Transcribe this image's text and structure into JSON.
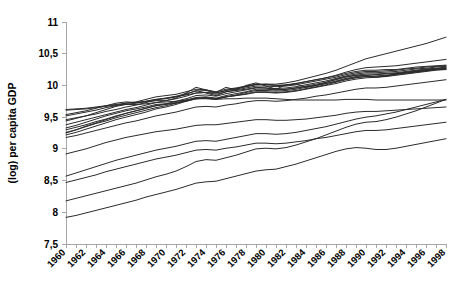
{
  "chart_data": {
    "type": "line",
    "title": "",
    "subtitle": "",
    "xlabel": "",
    "ylabel": "(log) per capita GDP",
    "xlim": [
      1960,
      1998
    ],
    "ylim": [
      7.5,
      11
    ],
    "grid": false,
    "legend": false,
    "legend_position": "none",
    "line_color": "#2b2b2b",
    "axis_color": "#a6a6a6",
    "ytick_labels": [
      "7,5",
      "8",
      "8,5",
      "9",
      "9,5",
      "10",
      "10,5",
      "11"
    ],
    "ytick_values": [
      7.5,
      8,
      8.5,
      9,
      9.5,
      10,
      10.5,
      11
    ],
    "xtick_labels": [
      "1960",
      "1962",
      "1964",
      "1966",
      "1968",
      "1970",
      "1972",
      "1974",
      "1976",
      "1978",
      "1980",
      "1982",
      "1984",
      "1986",
      "1988",
      "1990",
      "1992",
      "1994",
      "1996",
      "1998"
    ],
    "xtick_values": [
      1960,
      1962,
      1964,
      1966,
      1968,
      1970,
      1972,
      1974,
      1976,
      1978,
      1980,
      1982,
      1984,
      1986,
      1988,
      1990,
      1992,
      1994,
      1996,
      1998
    ],
    "x": [
      1960,
      1961,
      1962,
      1963,
      1964,
      1965,
      1966,
      1967,
      1968,
      1969,
      1970,
      1971,
      1972,
      1973,
      1974,
      1975,
      1976,
      1977,
      1978,
      1979,
      1980,
      1981,
      1982,
      1983,
      1984,
      1985,
      1986,
      1987,
      1988,
      1989,
      1990,
      1991,
      1992,
      1993,
      1994,
      1995,
      1996,
      1997,
      1998
    ],
    "series": [
      {
        "name": "series-1",
        "values": [
          9.62,
          9.63,
          9.64,
          9.66,
          9.68,
          9.7,
          9.72,
          9.73,
          9.75,
          9.78,
          9.8,
          9.82,
          9.85,
          9.88,
          9.89,
          9.88,
          9.92,
          9.95,
          9.98,
          10.01,
          10.02,
          10.02,
          10.04,
          10.07,
          10.11,
          10.15,
          10.19,
          10.24,
          10.3,
          10.36,
          10.42,
          10.46,
          10.5,
          10.54,
          10.58,
          10.62,
          10.66,
          10.71,
          10.76
        ]
      },
      {
        "name": "series-2",
        "values": [
          9.52,
          9.55,
          9.58,
          9.61,
          9.65,
          9.68,
          9.72,
          9.74,
          9.78,
          9.82,
          9.84,
          9.86,
          9.9,
          9.94,
          9.93,
          9.9,
          9.94,
          9.96,
          9.99,
          10.02,
          10.01,
          10.0,
          10.01,
          10.03,
          10.06,
          10.09,
          10.12,
          10.16,
          10.21,
          10.25,
          10.28,
          10.29,
          10.3,
          10.31,
          10.33,
          10.35,
          10.37,
          10.39,
          10.41
        ]
      },
      {
        "name": "series-3",
        "values": [
          9.46,
          9.49,
          9.52,
          9.55,
          9.59,
          9.62,
          9.66,
          9.69,
          9.73,
          9.77,
          9.8,
          9.83,
          9.87,
          9.91,
          9.92,
          9.88,
          9.92,
          9.95,
          9.98,
          10.02,
          10.02,
          10.0,
          10.0,
          10.03,
          10.06,
          10.09,
          10.12,
          10.15,
          10.19,
          10.22,
          10.24,
          10.24,
          10.25,
          10.25,
          10.27,
          10.29,
          10.3,
          10.31,
          10.32
        ]
      },
      {
        "name": "series-4",
        "values": [
          9.38,
          9.42,
          9.46,
          9.5,
          9.54,
          9.58,
          9.62,
          9.65,
          9.69,
          9.73,
          9.76,
          9.79,
          9.83,
          9.88,
          9.89,
          9.86,
          9.9,
          9.93,
          9.96,
          9.99,
          9.99,
          9.98,
          9.99,
          10.01,
          10.04,
          10.07,
          10.1,
          10.13,
          10.17,
          10.2,
          10.22,
          10.22,
          10.23,
          10.24,
          10.26,
          10.27,
          10.29,
          10.3,
          10.31
        ]
      },
      {
        "name": "series-5",
        "values": [
          9.3,
          9.34,
          9.38,
          9.43,
          9.47,
          9.52,
          9.56,
          9.6,
          9.64,
          9.68,
          9.71,
          9.75,
          9.79,
          9.84,
          9.85,
          9.83,
          9.87,
          9.9,
          9.93,
          9.96,
          9.96,
          9.95,
          9.96,
          9.98,
          10.01,
          10.04,
          10.07,
          10.11,
          10.15,
          10.18,
          10.2,
          10.2,
          10.21,
          10.22,
          10.24,
          10.26,
          10.27,
          10.29,
          10.3
        ]
      },
      {
        "name": "series-6",
        "values": [
          9.26,
          9.3,
          9.35,
          9.4,
          9.44,
          9.49,
          9.53,
          9.57,
          9.61,
          9.65,
          9.68,
          9.72,
          9.77,
          9.81,
          9.82,
          9.8,
          9.84,
          9.87,
          9.9,
          9.94,
          9.94,
          9.93,
          9.94,
          9.96,
          9.99,
          10.02,
          10.05,
          10.09,
          10.13,
          10.16,
          10.18,
          10.18,
          10.19,
          10.2,
          10.22,
          10.24,
          10.26,
          10.27,
          10.29
        ]
      },
      {
        "name": "series-7",
        "values": [
          9.22,
          9.26,
          9.31,
          9.36,
          9.41,
          9.46,
          9.5,
          9.54,
          9.58,
          9.63,
          9.66,
          9.7,
          9.75,
          9.79,
          9.8,
          9.78,
          9.82,
          9.85,
          9.89,
          9.92,
          9.92,
          9.91,
          9.92,
          9.94,
          9.97,
          10.0,
          10.03,
          10.07,
          10.11,
          10.14,
          10.16,
          10.17,
          10.18,
          10.19,
          10.21,
          10.23,
          10.25,
          10.26,
          10.28
        ]
      },
      {
        "name": "series-8",
        "values": [
          9.25,
          9.3,
          9.36,
          9.41,
          9.46,
          9.51,
          9.56,
          9.6,
          9.64,
          9.68,
          9.7,
          9.72,
          9.75,
          9.79,
          9.8,
          9.79,
          9.82,
          9.84,
          9.87,
          9.9,
          9.9,
          9.89,
          9.9,
          9.92,
          9.95,
          9.98,
          10.01,
          10.05,
          10.09,
          10.12,
          10.14,
          10.15,
          10.16,
          10.18,
          10.2,
          10.22,
          10.24,
          10.26,
          10.27
        ]
      },
      {
        "name": "series-9",
        "values": [
          9.33,
          9.37,
          9.42,
          9.47,
          9.52,
          9.56,
          9.6,
          9.63,
          9.66,
          9.7,
          9.71,
          9.73,
          9.76,
          9.8,
          9.81,
          9.79,
          9.82,
          9.84,
          9.86,
          9.89,
          9.89,
          9.88,
          9.89,
          9.91,
          9.94,
          9.97,
          10.0,
          10.03,
          10.07,
          10.1,
          10.12,
          10.13,
          10.15,
          10.17,
          10.19,
          10.21,
          10.23,
          10.25,
          10.26
        ]
      },
      {
        "name": "series-10",
        "values": [
          9.44,
          9.48,
          9.52,
          9.57,
          9.62,
          9.67,
          9.7,
          9.72,
          9.74,
          9.76,
          9.76,
          9.8,
          9.88,
          9.97,
          9.93,
          9.89,
          9.97,
          9.93,
          10.0,
          10.04,
          9.99,
          9.94,
          10.01,
          10.02,
          9.97,
          10.0,
          10.05,
          10.1,
          10.14,
          10.16,
          10.16,
          10.13,
          10.15,
          10.18,
          10.2,
          10.22,
          10.23,
          10.25,
          10.26
        ]
      },
      {
        "name": "series-11",
        "values": [
          9.54,
          9.57,
          9.6,
          9.64,
          9.68,
          9.72,
          9.74,
          9.73,
          9.75,
          9.78,
          9.79,
          9.82,
          9.86,
          9.92,
          9.88,
          9.84,
          9.9,
          9.92,
          9.94,
          9.97,
          9.96,
          9.93,
          9.94,
          9.96,
          9.98,
          10.0,
          10.03,
          10.06,
          10.1,
          10.13,
          10.14,
          10.13,
          10.14,
          10.16,
          10.18,
          10.2,
          10.22,
          10.24,
          10.25
        ]
      },
      {
        "name": "series-12",
        "values": [
          9.61,
          9.62,
          9.63,
          9.65,
          9.67,
          9.69,
          9.7,
          9.7,
          9.71,
          9.73,
          9.74,
          9.75,
          9.77,
          9.79,
          9.79,
          9.78,
          9.79,
          9.79,
          9.8,
          9.8,
          9.8,
          9.79,
          9.78,
          9.77,
          9.77,
          9.77,
          9.77,
          9.77,
          9.78,
          9.78,
          9.78,
          9.77,
          9.77,
          9.77,
          9.77,
          9.77,
          9.77,
          9.77,
          9.77
        ]
      },
      {
        "name": "series-13",
        "values": [
          9.18,
          9.21,
          9.25,
          9.29,
          9.33,
          9.37,
          9.41,
          9.44,
          9.48,
          9.52,
          9.55,
          9.58,
          9.62,
          9.66,
          9.67,
          9.66,
          9.69,
          9.71,
          9.74,
          9.76,
          9.76,
          9.75,
          9.76,
          9.78,
          9.8,
          9.83,
          9.85,
          9.88,
          9.91,
          9.94,
          9.96,
          9.96,
          9.97,
          9.99,
          10.01,
          10.03,
          10.05,
          10.07,
          10.09
        ]
      },
      {
        "name": "series-14",
        "values": [
          8.92,
          8.96,
          9.0,
          9.05,
          9.1,
          9.14,
          9.18,
          9.21,
          9.24,
          9.27,
          9.29,
          9.31,
          9.34,
          9.37,
          9.38,
          9.38,
          9.4,
          9.42,
          9.44,
          9.46,
          9.46,
          9.45,
          9.45,
          9.46,
          9.47,
          9.49,
          9.51,
          9.53,
          9.56,
          9.58,
          9.59,
          9.59,
          9.6,
          9.61,
          9.62,
          9.63,
          9.64,
          9.65,
          9.66
        ]
      },
      {
        "name": "series-15",
        "values": [
          8.57,
          8.62,
          8.67,
          8.72,
          8.77,
          8.82,
          8.86,
          8.9,
          8.94,
          8.98,
          9.01,
          9.04,
          9.08,
          9.12,
          9.13,
          9.12,
          9.15,
          9.18,
          9.21,
          9.24,
          9.24,
          9.23,
          9.24,
          9.26,
          9.29,
          9.32,
          9.35,
          9.39,
          9.43,
          9.47,
          9.5,
          9.52,
          9.55,
          9.58,
          9.62,
          9.66,
          9.7,
          9.74,
          9.78
        ]
      },
      {
        "name": "series-16",
        "values": [
          8.47,
          8.51,
          8.55,
          8.59,
          8.64,
          8.68,
          8.72,
          8.76,
          8.8,
          8.84,
          8.87,
          8.9,
          8.94,
          8.98,
          8.99,
          8.98,
          9.01,
          9.03,
          9.06,
          9.09,
          9.09,
          9.08,
          9.09,
          9.11,
          9.13,
          9.16,
          9.18,
          9.21,
          9.24,
          9.27,
          9.29,
          9.29,
          9.3,
          9.32,
          9.34,
          9.36,
          9.38,
          9.4,
          9.42
        ]
      },
      {
        "name": "series-17",
        "values": [
          8.18,
          8.22,
          8.26,
          8.3,
          8.34,
          8.38,
          8.42,
          8.46,
          8.51,
          8.56,
          8.6,
          8.65,
          8.72,
          8.8,
          8.83,
          8.82,
          8.86,
          8.9,
          8.95,
          9.0,
          9.01,
          9.0,
          9.02,
          9.06,
          9.11,
          9.16,
          9.22,
          9.28,
          9.34,
          9.39,
          9.42,
          9.43,
          9.46,
          9.5,
          9.55,
          9.6,
          9.66,
          9.72,
          9.78
        ]
      },
      {
        "name": "series-18",
        "values": [
          7.92,
          7.95,
          7.99,
          8.03,
          8.07,
          8.11,
          8.15,
          8.19,
          8.24,
          8.28,
          8.32,
          8.36,
          8.41,
          8.46,
          8.48,
          8.49,
          8.53,
          8.57,
          8.61,
          8.65,
          8.67,
          8.68,
          8.72,
          8.76,
          8.81,
          8.86,
          8.91,
          8.96,
          9.0,
          9.02,
          9.01,
          8.99,
          8.99,
          9.01,
          9.04,
          9.07,
          9.1,
          9.13,
          9.16
        ]
      }
    ]
  },
  "axes": {
    "y_axis_title": "(log) per capita GDP"
  }
}
